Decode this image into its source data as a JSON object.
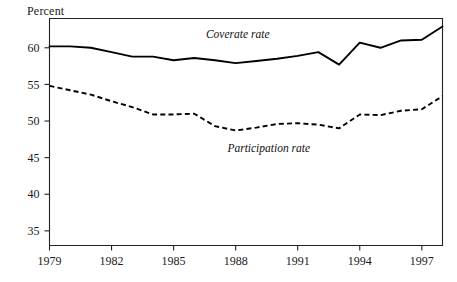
{
  "chart_data": {
    "type": "line",
    "title": "",
    "xlabel": "",
    "ylabel": "Percent",
    "ylim": [
      33,
      64
    ],
    "xlim": [
      1979,
      1998
    ],
    "grid": false,
    "legend_position": "inline-annotation",
    "yticks": [
      35,
      40,
      45,
      50,
      55,
      60
    ],
    "ytick_labels": [
      "35",
      "40",
      "45",
      "50",
      "55",
      "60"
    ],
    "xticks": [
      1979,
      1982,
      1985,
      1988,
      1991,
      1994,
      1997
    ],
    "xtick_labels": [
      "1979",
      "1982",
      "1985",
      "1988",
      "1991",
      "1994",
      "1997"
    ],
    "x": [
      1979,
      1980,
      1981,
      1982,
      1983,
      1984,
      1985,
      1986,
      1987,
      1988,
      1989,
      1990,
      1991,
      1992,
      1993,
      1994,
      1995,
      1996,
      1997,
      1998
    ],
    "series": [
      {
        "name": "Coverate rate",
        "style": "solid",
        "values": [
          60.2,
          60.2,
          60.0,
          59.4,
          58.8,
          58.8,
          58.3,
          58.6,
          58.3,
          57.9,
          58.2,
          58.5,
          58.9,
          59.4,
          57.7,
          60.7,
          60.0,
          61.0,
          61.1,
          62.9
        ]
      },
      {
        "name": "Participation rate",
        "style": "dashed",
        "values": [
          54.8,
          54.2,
          53.6,
          52.7,
          51.9,
          50.9,
          50.9,
          51.0,
          49.3,
          48.7,
          49.1,
          49.6,
          49.7,
          49.5,
          49.0,
          50.9,
          50.8,
          51.4,
          51.6,
          53.4
        ]
      }
    ],
    "annotations": [
      {
        "text": "Coverate rate",
        "x": 1988.1,
        "y": 61.4
      },
      {
        "text": "Participation rate",
        "x": 1989.6,
        "y": 45.8
      }
    ]
  }
}
